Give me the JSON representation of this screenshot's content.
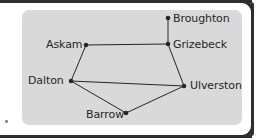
{
  "figure": {
    "type": "network-graph",
    "panel_color": "#d9d9d9",
    "page_color": "#ffffff",
    "ink_color": "#262626",
    "nodes": [
      {
        "id": "broughton",
        "label": "Broughton",
        "x": 168,
        "y": 18,
        "label_x": 173,
        "label_y": 13
      },
      {
        "id": "grizebeck",
        "label": "Grizebeck",
        "x": 168,
        "y": 44,
        "label_x": 173,
        "label_y": 39
      },
      {
        "id": "askam",
        "label": "Askam",
        "x": 86,
        "y": 45,
        "label_x": 46,
        "label_y": 39
      },
      {
        "id": "dalton",
        "label": "Dalton",
        "x": 71,
        "y": 81,
        "label_x": 28,
        "label_y": 75
      },
      {
        "id": "ulverston",
        "label": "Ulverston",
        "x": 184,
        "y": 86,
        "label_x": 190,
        "label_y": 80
      },
      {
        "id": "barrow",
        "label": "Barrow",
        "x": 126,
        "y": 113,
        "label_x": 86,
        "label_y": 109
      }
    ],
    "edges": [
      {
        "from": "broughton",
        "to": "grizebeck"
      },
      {
        "from": "askam",
        "to": "grizebeck"
      },
      {
        "from": "askam",
        "to": "dalton"
      },
      {
        "from": "grizebeck",
        "to": "ulverston"
      },
      {
        "from": "dalton",
        "to": "ulverston"
      },
      {
        "from": "dalton",
        "to": "barrow"
      },
      {
        "from": "barrow",
        "to": "ulverston"
      }
    ]
  }
}
